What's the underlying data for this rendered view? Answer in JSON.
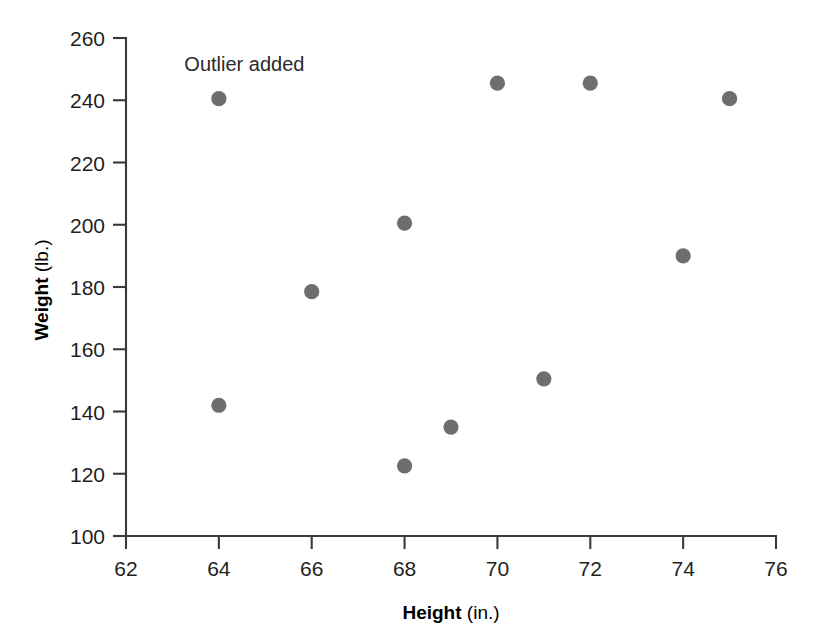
{
  "chart_data": {
    "type": "scatter",
    "title": "",
    "xlabel": "Height",
    "xlabel_units": "(in.)",
    "ylabel": "Weight",
    "ylabel_units": "(lb.)",
    "xlim": [
      62,
      76
    ],
    "ylim": [
      100,
      260
    ],
    "xticks": [
      62,
      64,
      66,
      68,
      70,
      72,
      74,
      76
    ],
    "yticks": [
      100,
      120,
      140,
      160,
      180,
      200,
      220,
      240,
      260
    ],
    "xtick_labels": [
      "62",
      "64",
      "66",
      "68",
      "70",
      "72",
      "74",
      "76"
    ],
    "ytick_labels": [
      "100",
      "120",
      "140",
      "160",
      "180",
      "200",
      "220",
      "240",
      "260"
    ],
    "grid": false,
    "legend": false,
    "point_color": "#6e6e6e",
    "axis_color": "#3a3a3a",
    "points": [
      {
        "x": 64,
        "y": 240.5,
        "label": "outlier"
      },
      {
        "x": 64,
        "y": 142.0,
        "label": ""
      },
      {
        "x": 66,
        "y": 178.5,
        "label": ""
      },
      {
        "x": 68,
        "y": 200.5,
        "label": ""
      },
      {
        "x": 68,
        "y": 122.5,
        "label": ""
      },
      {
        "x": 69,
        "y": 135.0,
        "label": ""
      },
      {
        "x": 70,
        "y": 245.5,
        "label": ""
      },
      {
        "x": 71,
        "y": 150.5,
        "label": ""
      },
      {
        "x": 72,
        "y": 245.5,
        "label": ""
      },
      {
        "x": 74,
        "y": 190.0,
        "label": ""
      },
      {
        "x": 75,
        "y": 240.5,
        "label": ""
      }
    ],
    "annotations": [
      {
        "text": "Outlier added",
        "x": 64.55,
        "y": 249.5,
        "anchor": "middle"
      }
    ]
  }
}
